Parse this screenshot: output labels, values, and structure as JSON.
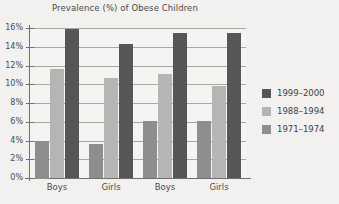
{
  "chart_data": {
    "type": "bar",
    "title": "Prevalence (%) of Obese Children",
    "xlabel": "",
    "ylabel": "",
    "ylim": [
      0,
      16
    ],
    "ytick_step": 2,
    "ytick_labels": [
      "16%",
      "14%",
      "12%",
      "10%",
      "8%",
      "6%",
      "4%",
      "2%",
      "0%"
    ],
    "ytick_values": [
      16,
      14,
      12,
      10,
      8,
      6,
      4,
      2,
      0
    ],
    "grid": true,
    "legend_position": "right",
    "categories": [
      "Boys",
      "Girls",
      "Boys",
      "Girls"
    ],
    "series": [
      {
        "name": "1971-1974",
        "color": "#8f8e8c",
        "values": [
          4.0,
          3.6,
          6.1,
          6.1
        ]
      },
      {
        "name": "1988-1994",
        "color": "#b6b5b3",
        "values": [
          11.6,
          10.7,
          11.1,
          9.8
        ]
      },
      {
        "name": "1999-2000",
        "color": "#565656",
        "values": [
          15.9,
          14.3,
          15.5,
          15.5
        ]
      }
    ]
  },
  "legend": {
    "items": [
      {
        "label": "1999–2000",
        "swatch": "s1999"
      },
      {
        "label": "1988–1994",
        "swatch": "s1988"
      },
      {
        "label": "1971–1974",
        "swatch": "s1971"
      }
    ]
  },
  "colors": {
    "background": "#f2f1ef",
    "plot_background": "#f5f4f2",
    "axis": "#6f6f6f",
    "gridline": "#a9a7a4",
    "text": "#4a4a4a",
    "series_1999_2000": "#565656",
    "series_1988_1994": "#b6b5b3",
    "series_1971_1974": "#8f8e8c"
  }
}
